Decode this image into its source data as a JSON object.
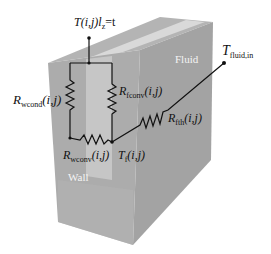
{
  "diagram": {
    "type": "thermal-resistance-network",
    "regions": {
      "fluid_label": "Fluid",
      "wall_label": "Wall"
    },
    "nodes": {
      "top": {
        "symbol": "T",
        "args": "(i,j)",
        "suffix": "l",
        "suffix_sub": "z",
        "eq": "=t"
      },
      "fluid_node": {
        "symbol": "T",
        "sub": "f",
        "args": "(i,j)"
      },
      "fluid_inlet": {
        "symbol": "T",
        "sub": "fluid,in"
      }
    },
    "resistors": {
      "wcond": {
        "symbol": "R",
        "sub": "wcond",
        "args": "(i,j)"
      },
      "fconv": {
        "symbol": "R",
        "sub": "fconv",
        "args": "(i,j)"
      },
      "wconv": {
        "symbol": "R",
        "sub": "wconv",
        "args": "(i,j)"
      },
      "fth": {
        "symbol": "R",
        "sub": "fth",
        "args": "(i,j)"
      }
    },
    "colors": {
      "top_face": "#b4b4b4",
      "top_stripe": "#d8d8d8",
      "front_wall": "#a9a9a9",
      "front_fluid": "#c4c4c4",
      "right_face": "#9c9c9c",
      "wire": "#111111"
    }
  }
}
